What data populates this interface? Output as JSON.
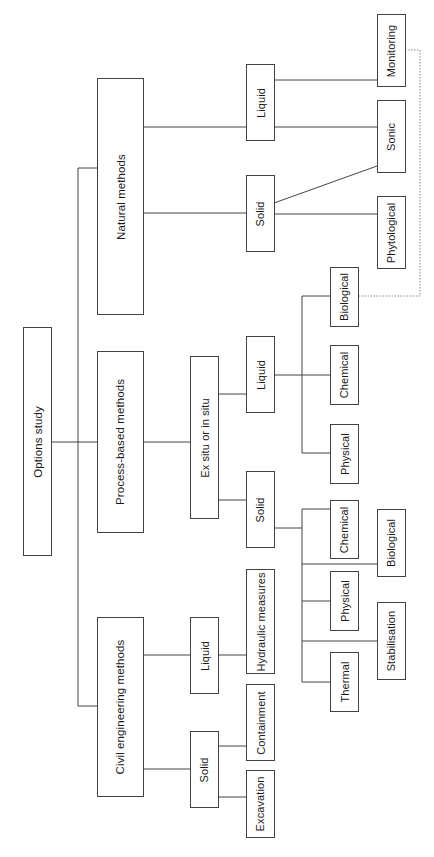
{
  "diagram": {
    "orientation": "rotated-90-ccw",
    "root": "Options study",
    "nodes": {
      "root": "Options study",
      "natural": "Natural methods",
      "process": "Process-based methods",
      "civil": "Civil engineering methods",
      "nat_liquid": "Liquid",
      "nat_solid": "Solid",
      "monitoring": "Monitoring",
      "sonic": "Sonic",
      "phytological": "Phytological",
      "exsitu": "Ex situ or in situ",
      "proc_liquid": "Liquid",
      "proc_solid": "Solid",
      "pl_biological": "Biological",
      "pl_chemical": "Chemical",
      "pl_physical": "Physical",
      "ps_chemical": "Chemical",
      "ps_biological": "Biological",
      "ps_physical": "Physical",
      "ps_stabilisation": "Stabilisation",
      "ps_thermal": "Thermal",
      "civ_liquid": "Liquid",
      "civ_solid": "Solid",
      "hydraulic": "Hydraulic measures",
      "containment": "Containment",
      "excavation": "Excavation"
    },
    "edges": [
      [
        "Options study",
        "Natural methods"
      ],
      [
        "Options study",
        "Process-based methods"
      ],
      [
        "Options study",
        "Civil engineering methods"
      ],
      [
        "Natural methods",
        "Liquid"
      ],
      [
        "Natural methods",
        "Solid"
      ],
      [
        "Liquid (natural)",
        "Monitoring"
      ],
      [
        "Liquid (natural)",
        "Sonic"
      ],
      [
        "Solid (natural)",
        "Sonic"
      ],
      [
        "Solid (natural)",
        "Phytological"
      ],
      [
        "Process-based methods",
        "Ex situ or in situ"
      ],
      [
        "Ex situ or in situ",
        "Liquid"
      ],
      [
        "Ex situ or in situ",
        "Solid"
      ],
      [
        "Liquid (process)",
        "Biological"
      ],
      [
        "Liquid (process)",
        "Chemical"
      ],
      [
        "Liquid (process)",
        "Physical"
      ],
      [
        "Solid (process)",
        "Chemical"
      ],
      [
        "Solid (process)",
        "Biological"
      ],
      [
        "Solid (process)",
        "Physical"
      ],
      [
        "Solid (process)",
        "Stabilisation"
      ],
      [
        "Solid (process)",
        "Thermal"
      ],
      [
        "Civil engineering methods",
        "Liquid"
      ],
      [
        "Civil engineering methods",
        "Solid"
      ],
      [
        "Liquid (civil)",
        "Hydraulic measures"
      ],
      [
        "Solid (civil)",
        "Containment"
      ],
      [
        "Solid (civil)",
        "Excavation"
      ]
    ],
    "dotted_edges": [
      [
        "Monitoring",
        "Biological (process liquid)"
      ]
    ],
    "colors": {
      "line": "#444444",
      "dotted": "#888888",
      "background": "#ffffff"
    }
  }
}
